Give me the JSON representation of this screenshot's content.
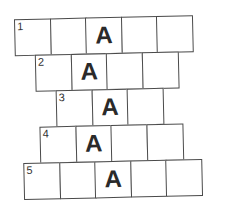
{
  "puzzle": {
    "rows": [
      {
        "number": "1",
        "cells": [
          "",
          "",
          "A",
          "",
          ""
        ],
        "left": 16,
        "top": 17
      },
      {
        "number": "2",
        "cells": [
          "",
          "A",
          "",
          ""
        ],
        "left": 36,
        "top": 53
      },
      {
        "number": "3",
        "cells": [
          "",
          "A",
          ""
        ],
        "left": 56,
        "top": 89
      },
      {
        "number": "4",
        "cells": [
          "",
          "A",
          "",
          ""
        ],
        "left": 39,
        "top": 125
      },
      {
        "number": "5",
        "cells": [
          "",
          "",
          "A",
          "",
          ""
        ],
        "left": 22,
        "top": 161
      }
    ]
  }
}
